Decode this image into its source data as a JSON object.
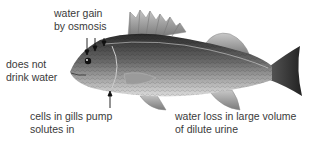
{
  "diagram": {
    "labels": {
      "water_gain": [
        "water gain",
        "by osmosis"
      ],
      "no_drink": [
        "does not",
        "drink water"
      ],
      "gills": [
        "cells in gills pump",
        "solutes in"
      ],
      "urine": [
        "water loss in large volume",
        "of dilute urine"
      ]
    }
  }
}
